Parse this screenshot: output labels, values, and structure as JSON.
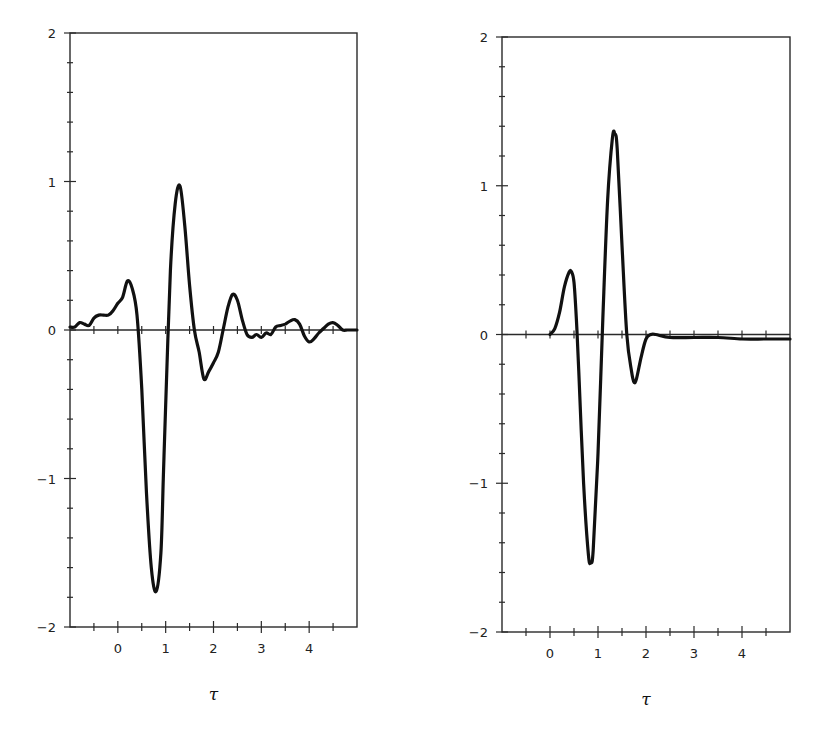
{
  "chart_data": [
    {
      "type": "line",
      "panel": "left",
      "title": "",
      "xlabel": "τ",
      "ylabel": "",
      "xlim": [
        -1,
        5
      ],
      "ylim": [
        -2,
        2
      ],
      "xticks": [
        0,
        1,
        2,
        3,
        4
      ],
      "xtick_labels": [
        "0",
        "1",
        "2",
        "3",
        "4"
      ],
      "yticks": [
        -2,
        -1,
        0,
        1,
        2
      ],
      "ytick_labels": [
        "-2",
        "-1",
        "0",
        "1",
        "2"
      ],
      "grid": false,
      "zero_line": true,
      "series": [
        {
          "name": "noisy waveform",
          "x": [
            -1.0,
            -0.9,
            -0.8,
            -0.7,
            -0.6,
            -0.5,
            -0.4,
            -0.3,
            -0.2,
            -0.1,
            0.0,
            0.1,
            0.2,
            0.3,
            0.4,
            0.5,
            0.6,
            0.7,
            0.8,
            0.9,
            0.95,
            1.0,
            1.1,
            1.2,
            1.3,
            1.4,
            1.5,
            1.6,
            1.7,
            1.8,
            1.9,
            2.0,
            2.1,
            2.2,
            2.3,
            2.4,
            2.5,
            2.6,
            2.7,
            2.8,
            2.9,
            3.0,
            3.1,
            3.2,
            3.3,
            3.4,
            3.5,
            3.6,
            3.7,
            3.8,
            3.9,
            4.0,
            4.1,
            4.2,
            4.3,
            4.4,
            4.5,
            4.6,
            4.7,
            4.8,
            4.9,
            5.0
          ],
          "values": [
            0.02,
            0.02,
            0.05,
            0.04,
            0.03,
            0.08,
            0.1,
            0.1,
            0.1,
            0.13,
            0.18,
            0.22,
            0.33,
            0.28,
            0.1,
            -0.4,
            -1.1,
            -1.6,
            -1.76,
            -1.5,
            -1.0,
            -0.5,
            0.4,
            0.85,
            0.97,
            0.7,
            0.3,
            0.0,
            -0.15,
            -0.33,
            -0.28,
            -0.22,
            -0.15,
            0.0,
            0.15,
            0.24,
            0.2,
            0.07,
            -0.03,
            -0.05,
            -0.03,
            -0.05,
            -0.02,
            -0.03,
            0.02,
            0.03,
            0.04,
            0.06,
            0.07,
            0.04,
            -0.04,
            -0.08,
            -0.06,
            -0.02,
            0.01,
            0.04,
            0.05,
            0.03,
            0.0,
            0.0,
            0.0,
            0.0
          ],
          "peak": {
            "x": 1.4,
            "y": 0.97
          },
          "trough": {
            "x": 0.92,
            "y": -1.76
          }
        }
      ]
    },
    {
      "type": "line",
      "panel": "right",
      "title": "",
      "xlabel": "τ",
      "ylabel": "",
      "xlim": [
        -1,
        5
      ],
      "ylim": [
        -2,
        2
      ],
      "xticks": [
        0,
        1,
        2,
        3,
        4
      ],
      "xtick_labels": [
        "0",
        "1",
        "2",
        "3",
        "4"
      ],
      "yticks": [
        -2,
        -1,
        0,
        1,
        2
      ],
      "ytick_labels": [
        "-2",
        "-1",
        "0",
        "1",
        "2"
      ],
      "grid": false,
      "zero_line": true,
      "series": [
        {
          "name": "clean waveform",
          "x": [
            0.0,
            0.1,
            0.2,
            0.3,
            0.4,
            0.45,
            0.5,
            0.55,
            0.6,
            0.7,
            0.8,
            0.85,
            0.9,
            1.0,
            1.1,
            1.2,
            1.3,
            1.35,
            1.4,
            1.5,
            1.6,
            1.7,
            1.75,
            1.8,
            1.9,
            2.0,
            2.1,
            2.2,
            2.5,
            3.0,
            3.5,
            4.0,
            4.5,
            5.0
          ],
          "values": [
            0.0,
            0.04,
            0.15,
            0.32,
            0.42,
            0.42,
            0.35,
            0.1,
            -0.25,
            -1.0,
            -1.48,
            -1.53,
            -1.45,
            -0.8,
            0.1,
            0.9,
            1.32,
            1.35,
            1.25,
            0.6,
            0.0,
            -0.25,
            -0.32,
            -0.3,
            -0.15,
            -0.03,
            0.0,
            0.0,
            -0.02,
            -0.02,
            -0.02,
            -0.03,
            -0.03,
            -0.03
          ],
          "peak": {
            "x": 1.35,
            "y": 1.35
          },
          "trough": {
            "x": 0.85,
            "y": -1.53
          }
        }
      ]
    }
  ],
  "panels": {
    "left": {
      "xlabel": "τ",
      "ytick_labels": [
        "2",
        "1",
        "0",
        "-1",
        "-2"
      ],
      "xtick_labels": [
        "0",
        "1",
        "2",
        "3",
        "4"
      ]
    },
    "right": {
      "xlabel": "τ",
      "ytick_labels": [
        "2",
        "1",
        "0",
        "-1",
        "-2"
      ],
      "xtick_labels": [
        "0",
        "1",
        "2",
        "3",
        "4"
      ]
    }
  },
  "colors": {
    "line": "#111111",
    "axis": "#2a2a2a",
    "background": "#ffffff"
  }
}
